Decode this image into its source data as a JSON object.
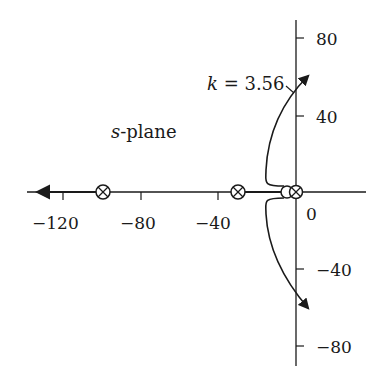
{
  "diagram": {
    "type": "root-locus",
    "plane_label_var": "s",
    "plane_label_rest": "-plane",
    "annotation": {
      "var": "k",
      "rest": " = 3.56"
    },
    "x_ticks": [
      {
        "value": -120,
        "label": "−120"
      },
      {
        "value": -80,
        "label": "−80"
      },
      {
        "value": -40,
        "label": "−40"
      },
      {
        "value": 0,
        "label": "0"
      }
    ],
    "y_ticks": [
      {
        "value": 80,
        "label": "80"
      },
      {
        "value": 40,
        "label": "40"
      },
      {
        "value": -40,
        "label": "−40"
      },
      {
        "value": -80,
        "label": "−80"
      }
    ],
    "poles": [
      -100,
      -30,
      -2
    ],
    "zeros": [
      -8
    ],
    "imag_axis_crossing_gain": 3.56,
    "colors": {
      "ink": "#1a1a1a",
      "background": "#ffffff"
    }
  }
}
